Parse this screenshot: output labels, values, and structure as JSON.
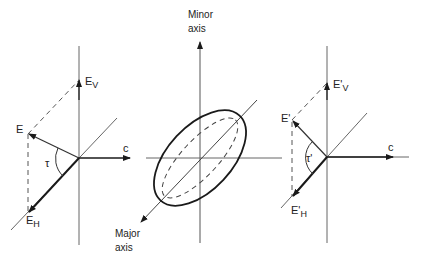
{
  "diagram": {
    "colors": {
      "line": "#555555",
      "bold": "#1a1a1a",
      "background": "#ffffff"
    },
    "left_panel": {
      "label_E": "E",
      "label_EV_main": "E",
      "label_EV_sub": "V",
      "label_EH_main": "E",
      "label_EH_sub": "H",
      "label_c": "c",
      "label_tau": "τ"
    },
    "center_panel": {
      "minor_axis_line1": "Minor",
      "minor_axis_line2": "axis",
      "major_axis_line1": "Major",
      "major_axis_line2": "axis"
    },
    "right_panel": {
      "label_E": "E'",
      "label_EV_main": "E'",
      "label_EV_sub": "V",
      "label_EH_main": "E'",
      "label_EH_sub": "H",
      "label_c": "c",
      "label_tau": "τ'"
    }
  }
}
